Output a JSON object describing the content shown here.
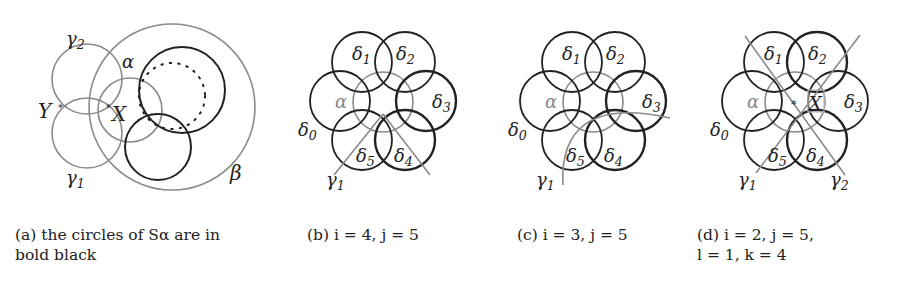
{
  "figure": {
    "colors": {
      "bold": "#222222",
      "gray": "#8a8a8a",
      "background": "#ffffff"
    },
    "panels": [
      {
        "id": "a",
        "caption_line1": "(a) the circles of Sα are in",
        "caption_line2": "bold black",
        "labels": {
          "gamma2": "γ",
          "gamma2_sub": "2",
          "gamma1": "γ",
          "gamma1_sub": "1",
          "alpha": "α",
          "beta": "β",
          "Y": "Y",
          "X": "X"
        }
      },
      {
        "id": "b",
        "caption_line1": "(b) i = 4, j = 5",
        "labels": {
          "delta": "δ",
          "d0": "0",
          "d1": "1",
          "d2": "2",
          "d3": "3",
          "d4": "4",
          "d5": "5",
          "alpha": "α",
          "gamma": "γ",
          "g1": "1"
        }
      },
      {
        "id": "c",
        "caption_line1": "(c) i = 3, j = 5",
        "labels": {
          "delta": "δ",
          "d0": "0",
          "d1": "1",
          "d2": "2",
          "d3": "3",
          "d4": "4",
          "d5": "5",
          "alpha": "α",
          "gamma": "γ",
          "g1": "1"
        }
      },
      {
        "id": "d",
        "caption_line1": "(d) i = 2, j = 5,",
        "caption_line2": "l = 1, k = 4",
        "labels": {
          "delta": "δ",
          "d0": "0",
          "d1": "1",
          "d2": "2",
          "d3": "3",
          "d4": "4",
          "d5": "5",
          "alpha": "α",
          "gamma": "γ",
          "g1": "1",
          "g2": "2",
          "X": "X"
        }
      }
    ]
  }
}
